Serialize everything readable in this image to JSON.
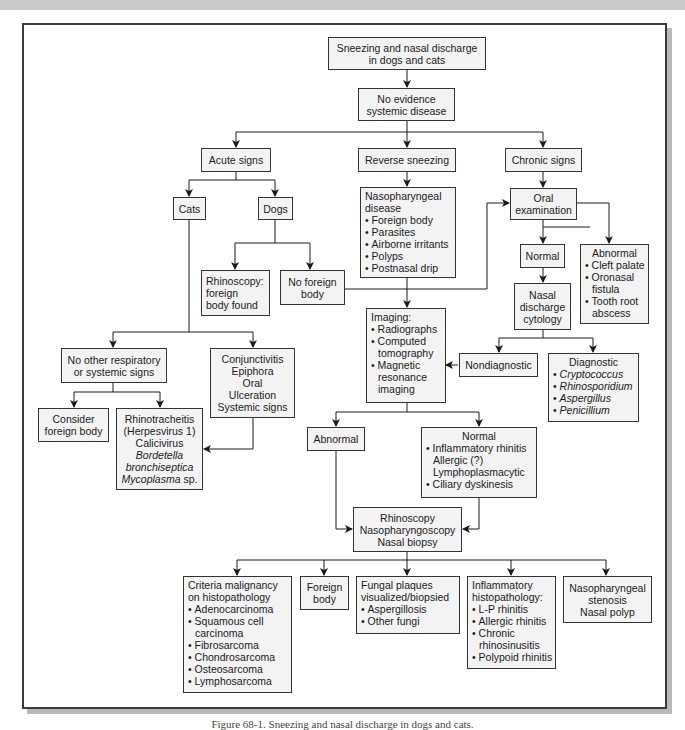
{
  "diagram": {
    "type": "flowchart",
    "title": "Sneezing and nasal discharge in dogs and cats",
    "caption": "Figure 68-1. Sneezing and nasal discharge in dogs and cats.",
    "nodes": {
      "start": {
        "lines": [
          "Sneezing and nasal discharge",
          "in dogs and cats"
        ]
      },
      "no_systemic": {
        "lines": [
          "No evidence",
          "systemic disease"
        ]
      },
      "acute": {
        "lines": [
          "Acute signs"
        ]
      },
      "reverse": {
        "lines": [
          "Reverse sneezing"
        ]
      },
      "chronic": {
        "lines": [
          "Chronic signs"
        ]
      },
      "cats": {
        "lines": [
          "Cats"
        ]
      },
      "dogs": {
        "lines": [
          "Dogs"
        ]
      },
      "naso_disease": {
        "title": [
          "Nasopharyngeal",
          "disease"
        ],
        "bullets": [
          "Foreign body",
          "Parasites",
          "Airborne irritants",
          "Polyps",
          "Postnasal drip"
        ]
      },
      "oral_exam": {
        "lines": [
          "Oral",
          "examination"
        ]
      },
      "rhino_found": {
        "lines": [
          "Rhinoscopy:",
          "foreign",
          "body found"
        ]
      },
      "no_foreign": {
        "lines": [
          "No foreign",
          "body"
        ]
      },
      "oral_normal": {
        "lines": [
          "Normal"
        ]
      },
      "oral_abnormal": {
        "title": "Abnormal",
        "bullets": [
          "Cleft palate",
          "Oronasal",
          "fistula",
          "Tooth root",
          "abscess"
        ]
      },
      "cytology": {
        "lines": [
          "Nasal",
          "discharge",
          "cytology"
        ]
      },
      "imaging": {
        "title": "Imaging:",
        "bullets": [
          "Radiographs",
          "Computed",
          "tomography",
          "Magnetic",
          "resonance",
          "imaging"
        ]
      },
      "nondiagnostic": {
        "lines": [
          "Nondiagnostic"
        ]
      },
      "diagnostic": {
        "title": "Diagnostic",
        "bullets": [
          "Cryptococcus",
          "Rhinosporidium",
          "Aspergillus",
          "Penicillium"
        ]
      },
      "no_other_signs": {
        "lines": [
          "No other respiratory",
          "or systemic signs"
        ]
      },
      "conjunctivitis": {
        "lines": [
          "Conjunctivitis",
          "Epiphora",
          "Oral",
          "Ulceration",
          "Systemic signs"
        ]
      },
      "consider_fb": {
        "lines": [
          "Consider",
          "foreign body"
        ]
      },
      "rhinotracheitis": {
        "lines": [
          "Rhinotracheitis",
          "(Herpesvirus 1)",
          "Calicivirus",
          "Bordetella",
          "bronchiseptica",
          "Mycoplasma",
          "sp."
        ]
      },
      "img_abnormal": {
        "lines": [
          "Abnormal"
        ]
      },
      "img_normal": {
        "title": "Normal",
        "lines": [
          "Inflammatory rhinitis",
          "Allergic (?)",
          "Lymphoplasmacytic",
          "Ciliary dyskinesis"
        ]
      },
      "rhinoscopy": {
        "lines": [
          "Rhinoscopy",
          "Nasopharyngoscopy",
          "Nasal biopsy"
        ]
      },
      "malignancy": {
        "title": [
          "Criteria malignancy",
          "on histopathology"
        ],
        "bullets": [
          "Adenocarcinoma",
          "Squamous cell",
          "carcinoma",
          "Fibrosarcoma",
          "Chondrosarcoma",
          "Osteosarcoma",
          "Lymphosarcoma"
        ]
      },
      "foreign_body": {
        "lines": [
          "Foreign",
          "body"
        ]
      },
      "fungal": {
        "title": [
          "Fungal plaques",
          "visualized/biopsied"
        ],
        "bullets": [
          "Aspergillosis",
          "Other fungi"
        ]
      },
      "inflammatory": {
        "title": [
          "Inflammatory",
          "histopathology:"
        ],
        "bullets": [
          "L-P rhinitis",
          "Allergic rhinitis",
          "Chronic",
          "rhinosinusitis",
          "Polypoid rhinitis"
        ]
      },
      "naso_stenosis": {
        "lines": [
          "Nasopharyngeal",
          "stenosis",
          "Nasal polyp"
        ]
      }
    },
    "colors": {
      "box_fill": "#f3f3f3",
      "box_border": "#333333",
      "line": "#1a1a1a",
      "frame": "#3a3a3a"
    }
  }
}
